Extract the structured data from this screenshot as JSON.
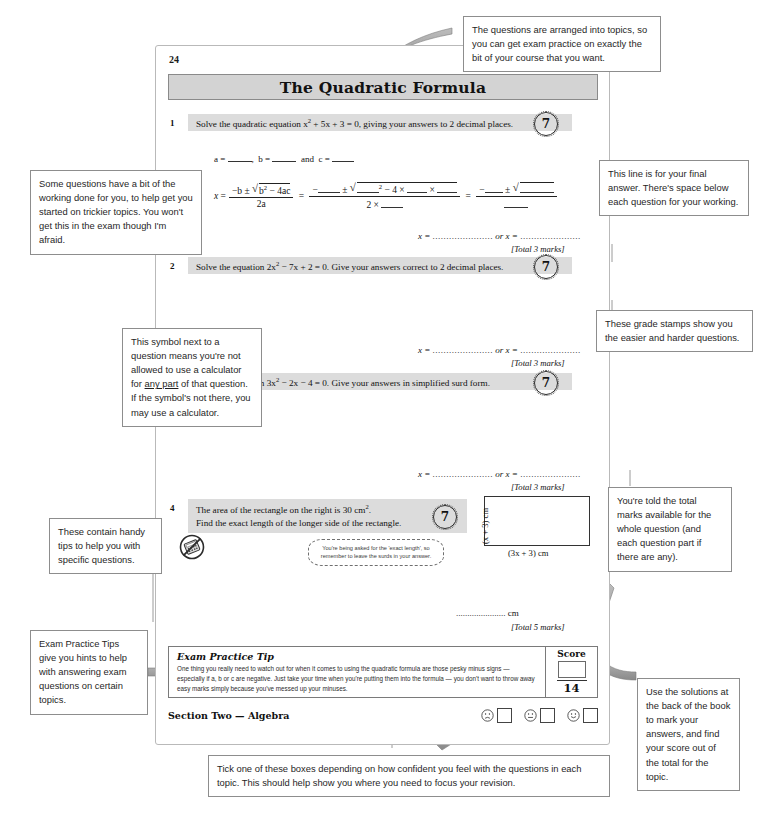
{
  "page": {
    "number": "24",
    "title": "The Quadratic Formula",
    "section_footer": "Section Two — Algebra"
  },
  "questions": [
    {
      "num": "1",
      "text_html": "Solve the quadratic equation x<sup>2</sup> + 5x + 3 = 0, giving your answers to 2 decimal places.",
      "grade": "7",
      "answer_prefix": "x = ",
      "answer_or": " or x = ",
      "total": "[Total 3 marks]",
      "working_abc": "a = ____,  b = ____  and  c = ____",
      "formula_label": "x ="
    },
    {
      "num": "2",
      "text_html": "Solve the equation 2x<sup>2</sup> − 7x + 2 = 0.  Give your answers correct to 2 decimal places.",
      "grade": "7",
      "answer_prefix": "x = ",
      "answer_or": " or x = ",
      "total": "[Total 3 marks]"
    },
    {
      "num": "3",
      "text_html": "Solve the equation 3x<sup>2</sup> − 2x − 4 = 0.  Give your answers in simplified surd form.",
      "grade": "7",
      "answer_prefix": "x = ",
      "answer_or": " or x = ",
      "total": "[Total 3 marks]"
    },
    {
      "num": "4",
      "text_html": "The area of the rectangle on the right is 30 cm<sup>2</sup>.<br>Find the exact length of the longer side of the rectangle.",
      "grade": "7",
      "answer_unit": "...................... cm",
      "total": "[Total 5 marks]",
      "figure": {
        "side_label": "(x + 3) cm",
        "base_label": "(3x + 3) cm"
      },
      "hint_bubble": "You're being asked for the 'exact length', so remember to leave the surds in your answer."
    }
  ],
  "stamp_ring_text": "GRADE",
  "exam_practice_tip": {
    "title": "Exam Practice Tip",
    "body": "One thing you really need to watch out for when it comes to using the quadratic formula are those pesky minus signs — especially if a, b or c are negative.  Just take your time when you're putting them into the formula — you don't want to throw away easy marks simply because you've messed up your minuses.",
    "score_label": "Score",
    "score_total": "14"
  },
  "annotations": [
    {
      "id": "topics-note",
      "text": "The questions are arranged into topics, so you can get exam practice on exactly the bit of your course that you want."
    },
    {
      "id": "working-note",
      "text": "Some questions have a bit of the working done for you, to help get you started on trickier topics.  You won't get this in the exam though I'm afraid."
    },
    {
      "id": "answer-line-note",
      "text": "This line is for your final answer.  There's space below each question for your working."
    },
    {
      "id": "grade-stamp-note",
      "text": "These grade stamps show you the easier and harder questions."
    },
    {
      "id": "calculator-note",
      "text_parts": [
        "This symbol next to a question means you're not allowed to use a calculator for ",
        "any part",
        " of that question.  If the symbol's not there, you may use a calculator."
      ]
    },
    {
      "id": "handy-tips-note",
      "text": "These contain handy tips to help you with specific questions."
    },
    {
      "id": "exam-practice-tips-note",
      "text": "Exam Practice Tips give you hints to help with answering exam questions on certain topics."
    },
    {
      "id": "total-marks-note",
      "text": "You're told the total marks available for the whole question (and each question part if there are any)."
    },
    {
      "id": "solutions-note",
      "text": "Use the solutions at the back of the book to mark your answers, and find your score out of the total for the topic."
    },
    {
      "id": "tickbox-note",
      "text": "Tick one of these boxes depending on how confident you feel with the questions in each topic.  This should help show you where you need to focus your revision."
    }
  ],
  "colors": {
    "question_band": "#dcdcdc",
    "title_band": "#d3d3d3",
    "arrow": "#8f8f8f",
    "note_border": "#8d8d8d"
  }
}
